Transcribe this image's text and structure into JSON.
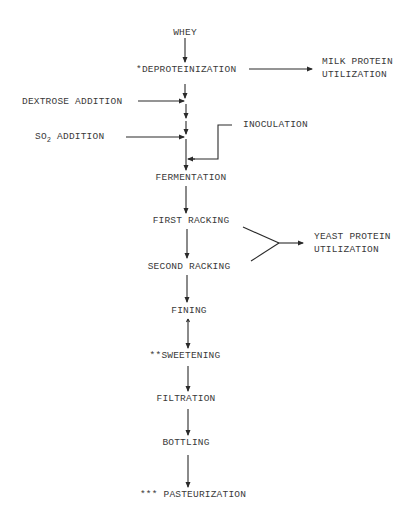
{
  "diagram": {
    "colors": {
      "line": "#2a2a2a",
      "text": "#3a3a3a",
      "background": "#ffffff"
    },
    "main_steps": [
      {
        "id": "whey",
        "label": "WHEY"
      },
      {
        "id": "deproteinization",
        "label": "*DEPROTEINIZATION"
      },
      {
        "id": "fermentation",
        "label": "FERMENTATION"
      },
      {
        "id": "first_racking",
        "label": "FIRST RACKING"
      },
      {
        "id": "second_racking",
        "label": "SECOND RACKING"
      },
      {
        "id": "fining",
        "label": "FINING"
      },
      {
        "id": "sweetening",
        "label": "**SWEETENING"
      },
      {
        "id": "filtration",
        "label": "FILTRATION"
      },
      {
        "id": "bottling",
        "label": "BOTTLING"
      },
      {
        "id": "pasteurization",
        "label": "*** PASTEURIZATION"
      }
    ],
    "inputs": {
      "dextrose": {
        "label": "DEXTROSE ADDITION"
      },
      "so2": {
        "label_prefix": "SO",
        "label_sub": "2",
        "label_suffix": " ADDITION"
      },
      "inoculation": {
        "label": "INOCULATION"
      }
    },
    "outputs": {
      "milk_protein": {
        "line1": "MILK PROTEIN",
        "line2": "UTILIZATION"
      },
      "yeast_protein": {
        "line1": "YEAST PROTEIN",
        "line2": "UTILIZATION"
      }
    },
    "edges": [
      [
        "whey",
        "deproteinization"
      ],
      [
        "deproteinization",
        "milk_protein"
      ],
      [
        "deproteinization",
        "fermentation"
      ],
      [
        "dextrose",
        "fermentation"
      ],
      [
        "so2",
        "fermentation"
      ],
      [
        "inoculation",
        "fermentation"
      ],
      [
        "fermentation",
        "first_racking"
      ],
      [
        "first_racking",
        "second_racking"
      ],
      [
        "first_racking",
        "yeast_protein"
      ],
      [
        "second_racking",
        "yeast_protein"
      ],
      [
        "second_racking",
        "fining"
      ],
      [
        "fining",
        "sweetening"
      ],
      [
        "sweetening",
        "filtration"
      ],
      [
        "filtration",
        "bottling"
      ],
      [
        "bottling",
        "pasteurization"
      ]
    ]
  }
}
